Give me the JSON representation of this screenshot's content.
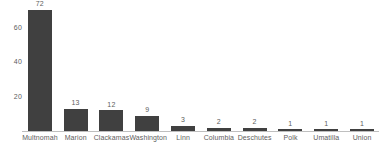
{
  "chart_data": {
    "type": "bar",
    "title": "",
    "subtitle": "",
    "xlabel": "",
    "ylabel": "",
    "categories": [
      "Multnomah",
      "Marion",
      "Clackamas",
      "Washington",
      "Linn",
      "Columbia",
      "Deschutes",
      "Polk",
      "Umatilla",
      "Union"
    ],
    "values": [
      72,
      13,
      12,
      9,
      3,
      2,
      2,
      1,
      1,
      1
    ],
    "data_labels": [
      "72",
      "13",
      "12",
      "9",
      "3",
      "2",
      "2",
      "1",
      "1",
      "1"
    ],
    "ylim": [
      0,
      76
    ],
    "yticks": [
      20,
      40,
      60
    ],
    "ytick_labels": [
      "20",
      "40",
      "60"
    ],
    "grid": false,
    "legend": false,
    "legend_position": "none",
    "orientation": "vertical",
    "bar_color": "#404040",
    "text_color": "#5d5d5d",
    "axis_color": "#bfbfbf",
    "background_color": "#ffffff"
  }
}
